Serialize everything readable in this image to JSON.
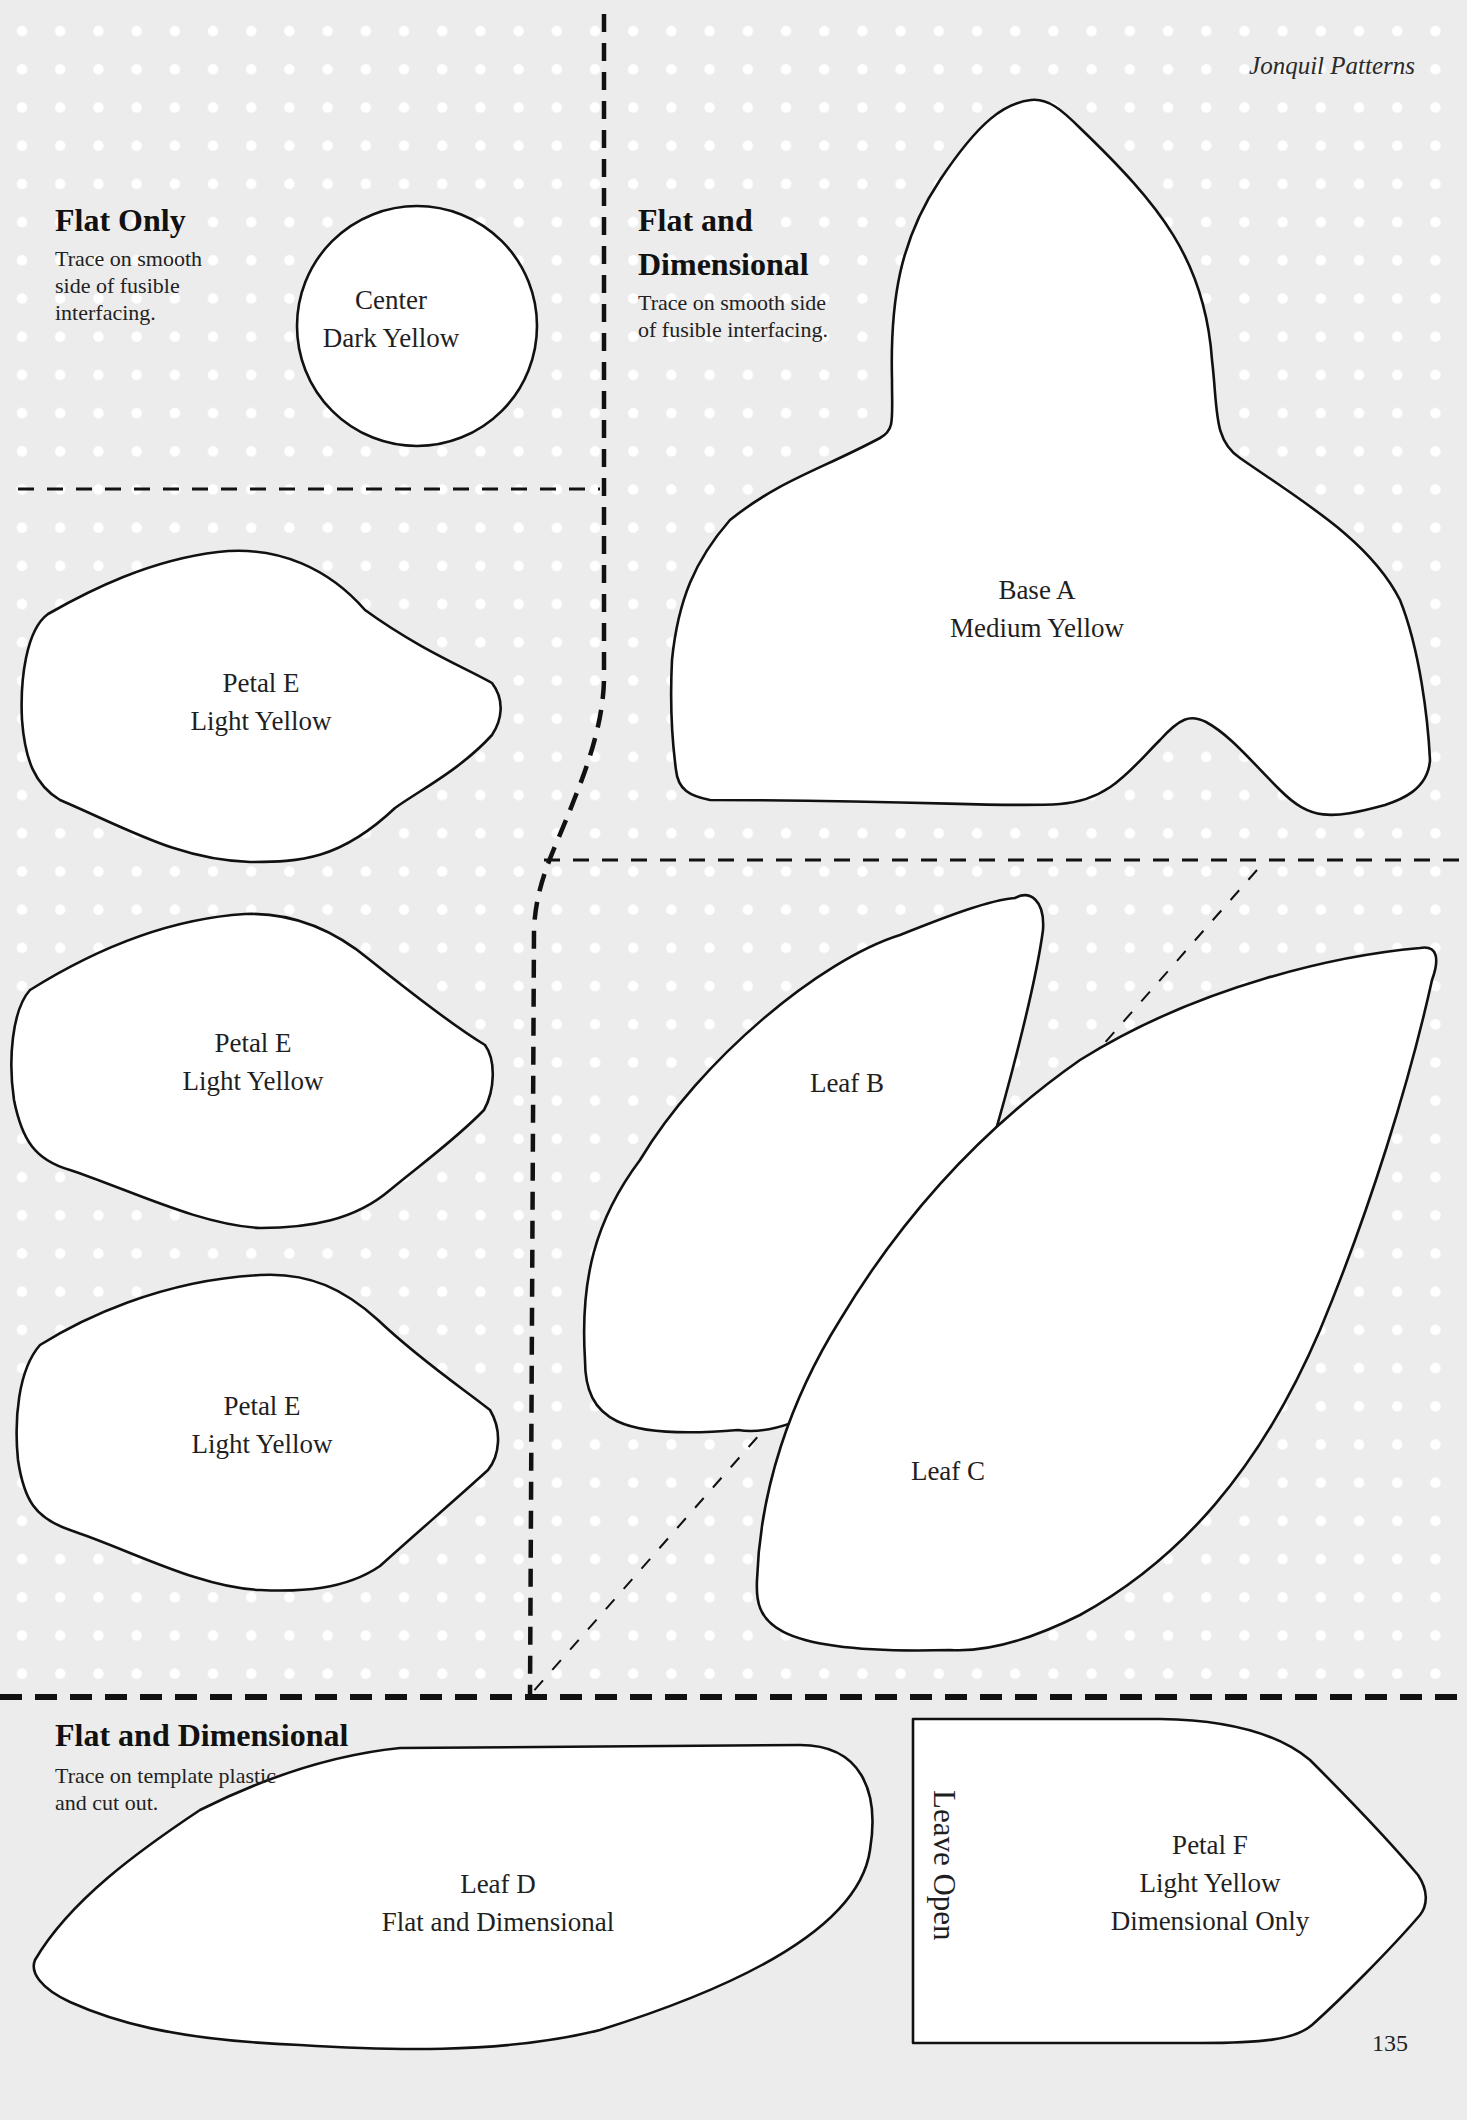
{
  "running_head": "Jonquil Patterns",
  "page_number": "135",
  "colors": {
    "page_background": "#ececec",
    "dot": "#ffffff",
    "shape_fill": "#ffffff",
    "outline": "#111111"
  },
  "sections": {
    "flat_only": {
      "title": "Flat Only",
      "instruction_lines": [
        "Trace on smooth",
        "side of fusible",
        "interfacing."
      ]
    },
    "flat_and_dimensional_top": {
      "title_lines": [
        "Flat and",
        "Dimensional"
      ],
      "instruction_lines": [
        "Trace on smooth side",
        "of fusible interfacing."
      ]
    },
    "flat_and_dimensional_bottom": {
      "title": "Flat and Dimensional",
      "instruction_lines": [
        "Trace on template plastic",
        "and cut out."
      ]
    }
  },
  "pieces": {
    "center": {
      "name": "Center",
      "color": "Dark Yellow"
    },
    "base_a": {
      "name": "Base A",
      "color": "Medium Yellow"
    },
    "petal_e_1": {
      "name": "Petal E",
      "color": "Light Yellow"
    },
    "petal_e_2": {
      "name": "Petal E",
      "color": "Light Yellow"
    },
    "petal_e_3": {
      "name": "Petal E",
      "color": "Light Yellow"
    },
    "leaf_b": {
      "name": "Leaf B"
    },
    "leaf_c": {
      "name": "Leaf C"
    },
    "leaf_d": {
      "name": "Leaf D",
      "note": "Flat and Dimensional"
    },
    "petal_f": {
      "name": "Petal F",
      "color": "Light Yellow",
      "note": "Dimensional Only",
      "edge_note": "Leave Open"
    }
  }
}
